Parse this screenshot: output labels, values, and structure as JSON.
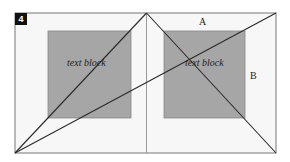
{
  "figure": {
    "badge": "4",
    "left_block_label": "text block",
    "right_block_label": "text block",
    "label_a": "A",
    "label_b": "B"
  },
  "colors": {
    "page_fill": "#f7f7f7",
    "block_fill": "#a6a6a6",
    "line": "#2a2a2a",
    "spine": "#999999"
  }
}
